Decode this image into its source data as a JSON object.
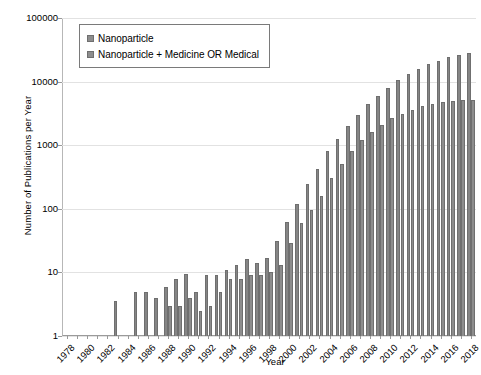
{
  "chart_data": {
    "type": "bar",
    "title": "",
    "xlabel": "Year",
    "ylabel": "Number of Publications per Year",
    "yscale": "log",
    "ylim": [
      1,
      100000
    ],
    "ytick_labels": [
      "100000",
      "10000",
      "1000",
      "100",
      "10",
      "1"
    ],
    "ytick_values": [
      100000,
      10000,
      1000,
      100,
      10,
      1
    ],
    "grid": true,
    "legend_position": "top-left",
    "categories": [
      "1978",
      "1979",
      "1980",
      "1981",
      "1982",
      "1983",
      "1984",
      "1985",
      "1986",
      "1987",
      "1988",
      "1989",
      "1990",
      "1991",
      "1992",
      "1993",
      "1994",
      "1995",
      "1996",
      "1997",
      "1998",
      "1999",
      "2000",
      "2001",
      "2002",
      "2003",
      "2004",
      "2005",
      "2006",
      "2007",
      "2008",
      "2009",
      "2010",
      "2011",
      "2012",
      "2013",
      "2014",
      "2015",
      "2016",
      "2017",
      "2018"
    ],
    "xtick_labels": [
      "1978",
      "1980",
      "1982",
      "1984",
      "1986",
      "1988",
      "1990",
      "1992",
      "1994",
      "1996",
      "1998",
      "2000",
      "2002",
      "2004",
      "2006",
      "2008",
      "2010",
      "2012",
      "2014",
      "2016",
      "2018"
    ],
    "series": [
      {
        "name": "Nanoparticle",
        "values": [
          0,
          0,
          0,
          0,
          0,
          3.5,
          0,
          5,
          5,
          4,
          6,
          8,
          9.5,
          5,
          9,
          9,
          11,
          13,
          16,
          14,
          17,
          31,
          62,
          120,
          250,
          430,
          800,
          1250,
          2000,
          3000,
          4400,
          6000,
          8000,
          10500,
          13000,
          16000,
          19000,
          21000,
          24000,
          26000,
          28000
        ]
      },
      {
        "name": "Nanoparticle + Medicine OR Medical",
        "values": [
          0,
          0,
          0,
          0,
          0,
          0,
          0,
          0,
          0,
          0,
          3,
          3,
          4,
          2.5,
          3,
          5,
          8,
          8,
          9,
          9,
          10,
          13,
          29,
          60,
          95,
          160,
          300,
          500,
          800,
          1200,
          1600,
          2100,
          2700,
          3100,
          3600,
          4100,
          4500,
          4700,
          5000,
          5100,
          5200
        ]
      }
    ]
  },
  "legend": {
    "items": [
      {
        "label": "Nanoparticle"
      },
      {
        "label": "Nanoparticle + Medicine OR Medical"
      }
    ]
  },
  "axes": {
    "y_title": "Number of Publications per Year",
    "x_title": "Year"
  }
}
